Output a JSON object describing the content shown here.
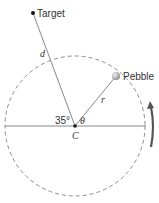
{
  "diagram": {
    "type": "circular-motion-geometry",
    "labels": {
      "target": "Target",
      "pebble": "Pebble",
      "center": "C",
      "distance": "d",
      "radius": "r",
      "angle_theta": "θ",
      "angle_fixed": "35°"
    },
    "geometry": {
      "center": [
        75,
        126
      ],
      "radius_px": 70,
      "target_point": [
        33,
        13
      ],
      "pebble_point": [
        116,
        76
      ],
      "target_angle_deg_from_left_horizontal": 35,
      "rotation_direction": "counterclockwise"
    },
    "colors": {
      "line": "#7a7a7a",
      "dashed_circle": "#808080",
      "arrow": "#555555",
      "pebble_fill": "#b0b0b0",
      "text": "#333333"
    }
  }
}
